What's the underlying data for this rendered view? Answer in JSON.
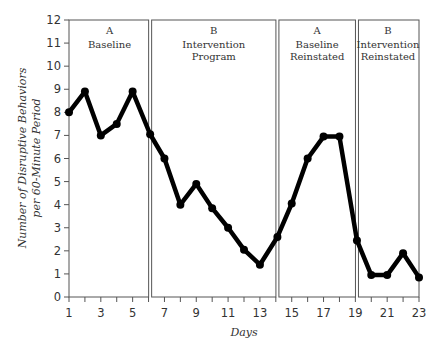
{
  "chart_data": {
    "type": "line",
    "title": "",
    "xlabel": "Days",
    "ylabel_lines": [
      "Number of Disruptive Behaviors",
      "per 60-Minute Period"
    ],
    "xlim": [
      1,
      23
    ],
    "ylim": [
      0,
      12
    ],
    "x_ticks_labeled": [
      1,
      3,
      5,
      7,
      9,
      11,
      13,
      15,
      17,
      19,
      21,
      23
    ],
    "y_ticks": [
      0,
      1,
      2,
      3,
      4,
      5,
      6,
      7,
      8,
      9,
      10,
      11,
      12
    ],
    "grid": false,
    "legend": null,
    "phases": [
      {
        "code": "A",
        "name_lines": [
          "Baseline"
        ],
        "start": 1,
        "end": 6.1
      },
      {
        "code": "B",
        "name_lines": [
          "Intervention",
          "Program"
        ],
        "start": 6.1,
        "end": 14.1
      },
      {
        "code": "A",
        "name_lines": [
          "Baseline",
          "Reinstated"
        ],
        "start": 14.1,
        "end": 19.1
      },
      {
        "code": "B",
        "name_lines": [
          "Intervention",
          "Reinstated"
        ],
        "start": 19.1,
        "end": 23
      }
    ],
    "series": [
      {
        "name": "Disruptive behaviors",
        "x": [
          1,
          2,
          3,
          4,
          5,
          6,
          7,
          8,
          9,
          10,
          11,
          12,
          13,
          14,
          15,
          16,
          17,
          18,
          19,
          20,
          21,
          22,
          23
        ],
        "values": [
          8,
          8.9,
          7,
          7.5,
          8.9,
          7.05,
          6,
          4,
          4.9,
          3.85,
          3,
          2.05,
          1.4,
          2.6,
          4.05,
          6,
          6.95,
          6.95,
          2.45,
          0.95,
          0.95,
          1.9,
          0.85
        ]
      }
    ]
  },
  "colors": {
    "line": "#000000",
    "frame": "#555555",
    "text": "#333333"
  }
}
